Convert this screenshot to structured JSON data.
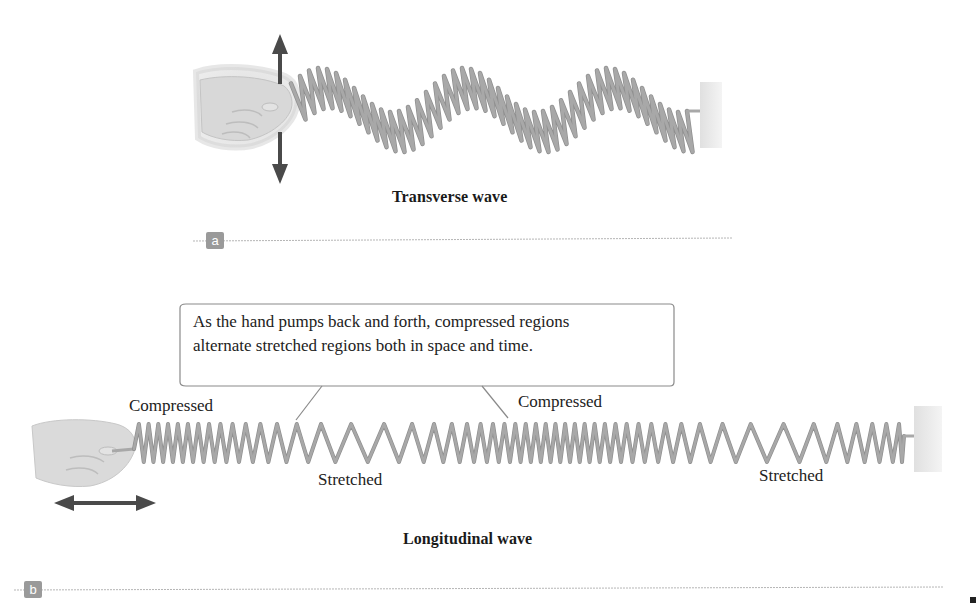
{
  "panel_a": {
    "badge": "a",
    "caption": "Transverse wave",
    "hand_motion": "up-down-arrow",
    "spring_color": "#a8a8a8",
    "wall_color": "#d9d9d9"
  },
  "panel_b": {
    "badge": "b",
    "caption": "Longitudinal wave",
    "callout": {
      "line1": "As the hand pumps back and forth, compressed regions",
      "line2": "alternate stretched regions both in space and time."
    },
    "labels": {
      "compressed_left": "Compressed",
      "compressed_right": "Compressed",
      "stretched_left": "Stretched",
      "stretched_right": "Stretched"
    },
    "hand_motion": "left-right-arrow",
    "spring_color": "#a8a8a8",
    "wall_color": "#d9d9d9"
  },
  "colors": {
    "arrow": "#4a4a4a",
    "rule": "#b5b5b5",
    "badge": "#9a9a9a",
    "callout_border": "#8a8a8a"
  }
}
